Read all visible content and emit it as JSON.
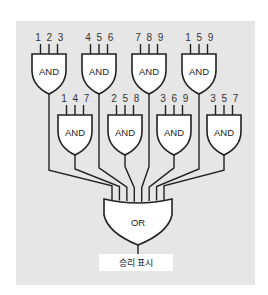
{
  "diagram": {
    "background_color": "#e6e6e6",
    "and_gates": [
      {
        "id": "and-123",
        "label": "AND",
        "inputs": "123",
        "x": 32,
        "y": 54,
        "row": 1
      },
      {
        "id": "and-456",
        "label": "AND",
        "inputs": "456",
        "x": 82,
        "y": 54,
        "row": 1
      },
      {
        "id": "and-789",
        "label": "AND",
        "inputs": "789",
        "x": 132,
        "y": 54,
        "row": 1
      },
      {
        "id": "and-159",
        "label": "AND",
        "inputs": "159",
        "x": 182,
        "y": 54,
        "row": 1
      },
      {
        "id": "and-147",
        "label": "AND",
        "inputs": "147",
        "x": 58,
        "y": 115,
        "row": 2
      },
      {
        "id": "and-258",
        "label": "AND",
        "inputs": "258",
        "x": 108,
        "y": 115,
        "row": 2
      },
      {
        "id": "and-369",
        "label": "AND",
        "inputs": "369",
        "x": 157,
        "y": 115,
        "row": 2
      },
      {
        "id": "and-357",
        "label": "AND",
        "inputs": "357",
        "x": 207,
        "y": 115,
        "row": 2
      }
    ],
    "or_gate": {
      "label": "OR",
      "x": 104,
      "y": 199,
      "width": 68
    },
    "output": {
      "label": "승리 표시"
    },
    "wire_order": [
      "and-123",
      "and-147",
      "and-456",
      "and-258",
      "and-789",
      "and-369",
      "and-159",
      "and-357"
    ]
  }
}
